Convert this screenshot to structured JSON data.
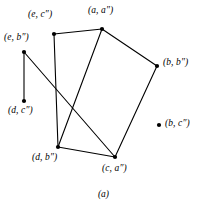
{
  "figure": {
    "caption": "(a)",
    "background_color": "#ffffff",
    "stroke_color": "#000000",
    "point_color": "#000000"
  },
  "chart_data": {
    "type": "scatter",
    "title": "(a)",
    "xlabel": "",
    "ylabel": "",
    "grid": false,
    "legend": null,
    "xlim": [
      0,
      207
    ],
    "ylim": [
      0,
      201
    ],
    "note": "Labeled point diagram: vertices joined by straight line segments forming two overlapping quadrilaterals, plus two isolated/pendant points.",
    "nodes": [
      {
        "id": "e_c",
        "label": "(e, c″)",
        "x": 54,
        "y": 34,
        "label_x": 28,
        "label_y": 10,
        "label_anchor": "left"
      },
      {
        "id": "a_a",
        "label": "(a, a″)",
        "x": 102,
        "y": 29,
        "label_x": 88,
        "label_y": 6,
        "label_anchor": "left"
      },
      {
        "id": "e_b",
        "label": "(e, b″)",
        "x": 24,
        "y": 52,
        "label_x": 4,
        "label_y": 33,
        "label_anchor": "left"
      },
      {
        "id": "b_b",
        "label": "(b, b″)",
        "x": 157,
        "y": 66,
        "label_x": 163,
        "label_y": 58,
        "label_anchor": "left"
      },
      {
        "id": "d_c",
        "label": "(d, c″)",
        "x": 24,
        "y": 101,
        "label_x": 8,
        "label_y": 106,
        "label_anchor": "left"
      },
      {
        "id": "b_c",
        "label": "(b, c″)",
        "x": 159,
        "y": 125,
        "label_x": 165,
        "label_y": 119,
        "label_anchor": "left"
      },
      {
        "id": "d_b",
        "label": "(d, b″)",
        "x": 58,
        "y": 147,
        "label_x": 32,
        "label_y": 153,
        "label_anchor": "left"
      },
      {
        "id": "c_a",
        "label": "(c, a″)",
        "x": 115,
        "y": 157,
        "label_x": 102,
        "label_y": 164,
        "label_anchor": "left"
      }
    ],
    "edges": [
      {
        "from": "e_c",
        "to": "a_a"
      },
      {
        "from": "e_c",
        "to": "d_b"
      },
      {
        "from": "a_a",
        "to": "b_b"
      },
      {
        "from": "a_a",
        "to": "d_b"
      },
      {
        "from": "b_b",
        "to": "c_a"
      },
      {
        "from": "d_b",
        "to": "c_a"
      },
      {
        "from": "e_b",
        "to": "d_c"
      },
      {
        "from": "e_b",
        "to": "c_a"
      }
    ],
    "isolated_nodes": [
      "b_c"
    ],
    "point_radius": 2.1,
    "stroke_width": 1.1
  }
}
